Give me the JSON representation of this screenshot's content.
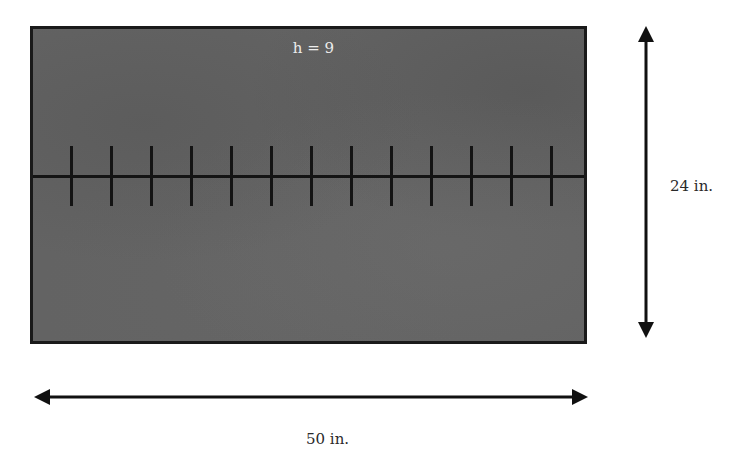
{
  "diagram": {
    "board": {
      "label": "h = 9",
      "fill_color": "#636363",
      "border_color": "#1a1a1a",
      "tick_count": 13,
      "tick_positions_px": [
        37,
        77,
        117,
        157,
        197,
        237,
        277,
        317,
        357,
        397,
        437,
        477,
        517
      ]
    },
    "dimensions": {
      "height_label": "24 in.",
      "width_label": "50 in."
    }
  }
}
